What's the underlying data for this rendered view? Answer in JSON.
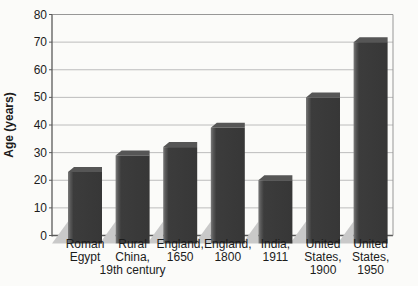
{
  "chart_data": {
    "type": "bar",
    "title": "",
    "xlabel": "",
    "ylabel": "Age (years)",
    "ylim": [
      0,
      80
    ],
    "ytick_step": 10,
    "yticks": [
      0,
      10,
      20,
      30,
      40,
      50,
      60,
      70,
      80
    ],
    "grid": true,
    "legend": null,
    "style": "3d-scanned-textbook",
    "categories": [
      "Roman Egypt",
      "Rural China, 19th century",
      "England, 1650",
      "England, 1800",
      "India, 1911",
      "United States, 1900",
      "United States, 1950"
    ],
    "category_label_lines": [
      [
        "Roman",
        "Egypt"
      ],
      [
        "Rural",
        "China,",
        "19th century"
      ],
      [
        "England,",
        "1650"
      ],
      [
        "England,",
        "1800"
      ],
      [
        "India,",
        "1911"
      ],
      [
        "United",
        "States,",
        "1900"
      ],
      [
        "United",
        "States,",
        "1950"
      ]
    ],
    "values": [
      23,
      29,
      32,
      39,
      20,
      50,
      70
    ],
    "colors": {
      "bar_front": "#3a3a3a",
      "bar_left_highlight": "#757575",
      "bar_top": "#565656",
      "floor_shadow": "#c9c9c9",
      "gridline": "#bcbcbc",
      "axis": "#5a5a5a",
      "plot_border": "#979797",
      "text": "#1c1c1c",
      "background": "#fbfbf9"
    }
  }
}
